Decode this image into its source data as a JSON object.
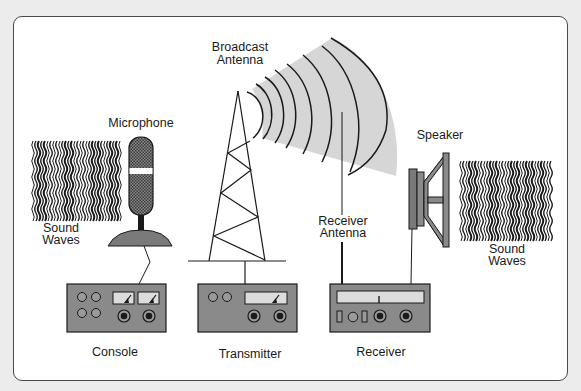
{
  "diagram": {
    "colors": {
      "background": "#ececec",
      "panel": "#ffffff",
      "device_fill": "#8a8a8a",
      "meter_fill": "#dcdcdc",
      "knob_fill": "#9a9a9a",
      "wave_fill": "#d6d6d6",
      "line": "#1a1a1a"
    },
    "labels": {
      "broadcast_antenna_line1": "Broadcast",
      "broadcast_antenna_line2": "Antenna",
      "microphone": "Microphone",
      "sound_waves_left_line1": "Sound",
      "sound_waves_left_line2": "Waves",
      "speaker": "Speaker",
      "receiver_antenna_line1": "Receiver",
      "receiver_antenna_line2": "Antenna",
      "sound_waves_right_line1": "Sound",
      "sound_waves_right_line2": "Waves",
      "console": "Console",
      "transmitter": "Transmitter",
      "receiver": "Receiver"
    },
    "nodes": [
      {
        "id": "sound-waves-in",
        "label": "Sound Waves"
      },
      {
        "id": "microphone",
        "label": "Microphone"
      },
      {
        "id": "console",
        "label": "Console"
      },
      {
        "id": "transmitter",
        "label": "Transmitter"
      },
      {
        "id": "broadcast-antenna",
        "label": "Broadcast Antenna"
      },
      {
        "id": "receiver-antenna",
        "label": "Receiver Antenna"
      },
      {
        "id": "receiver",
        "label": "Receiver"
      },
      {
        "id": "speaker",
        "label": "Speaker"
      },
      {
        "id": "sound-waves-out",
        "label": "Sound Waves"
      }
    ],
    "edges": [
      {
        "from": "sound-waves-in",
        "to": "microphone"
      },
      {
        "from": "microphone",
        "to": "console"
      },
      {
        "from": "transmitter",
        "to": "broadcast-antenna"
      },
      {
        "from": "broadcast-antenna",
        "to": "receiver-antenna"
      },
      {
        "from": "receiver-antenna",
        "to": "receiver"
      },
      {
        "from": "receiver",
        "to": "speaker"
      },
      {
        "from": "speaker",
        "to": "sound-waves-out"
      }
    ]
  }
}
